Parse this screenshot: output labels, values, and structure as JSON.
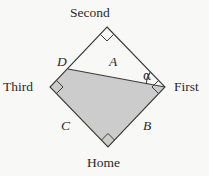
{
  "figure": {
    "background_color": "#f8f8f6",
    "line_color": "#3a3a3a",
    "shade_color": "#cccccc",
    "text_color": "#2b2b2b"
  },
  "vertices": [
    {
      "key": "second",
      "label": "Second",
      "x": 107,
      "y": 27,
      "right_angle": true
    },
    {
      "key": "first",
      "label": "First",
      "x": 165,
      "y": 87,
      "right_angle": true
    },
    {
      "key": "home",
      "label": "Home",
      "x": 108,
      "y": 147,
      "right_angle": true
    },
    {
      "key": "third",
      "label": "Third",
      "x": 50,
      "y": 87,
      "right_angle": true
    }
  ],
  "points": [
    {
      "key": "d",
      "label": "D",
      "x": 68,
      "y": 69
    }
  ],
  "regions": [
    {
      "key": "a",
      "label": "A",
      "shaded": false,
      "description": "triangle D-Second-First"
    },
    {
      "key": "shaded",
      "label": "",
      "shaded": true,
      "description": "quadrilateral D-First-Home-Third"
    }
  ],
  "side_labels": [
    {
      "key": "a",
      "label": "A"
    },
    {
      "key": "b",
      "label": "B"
    },
    {
      "key": "c",
      "label": "C"
    },
    {
      "key": "d",
      "label": "D"
    }
  ],
  "angles": [
    {
      "key": "alpha",
      "label": "α",
      "at_vertex": "first",
      "between": [
        "second",
        "d"
      ]
    }
  ],
  "labels": {
    "second": "Second",
    "first": "First",
    "home": "Home",
    "third": "Third",
    "a": "A",
    "b": "B",
    "c": "C",
    "d": "D",
    "alpha": "α"
  }
}
